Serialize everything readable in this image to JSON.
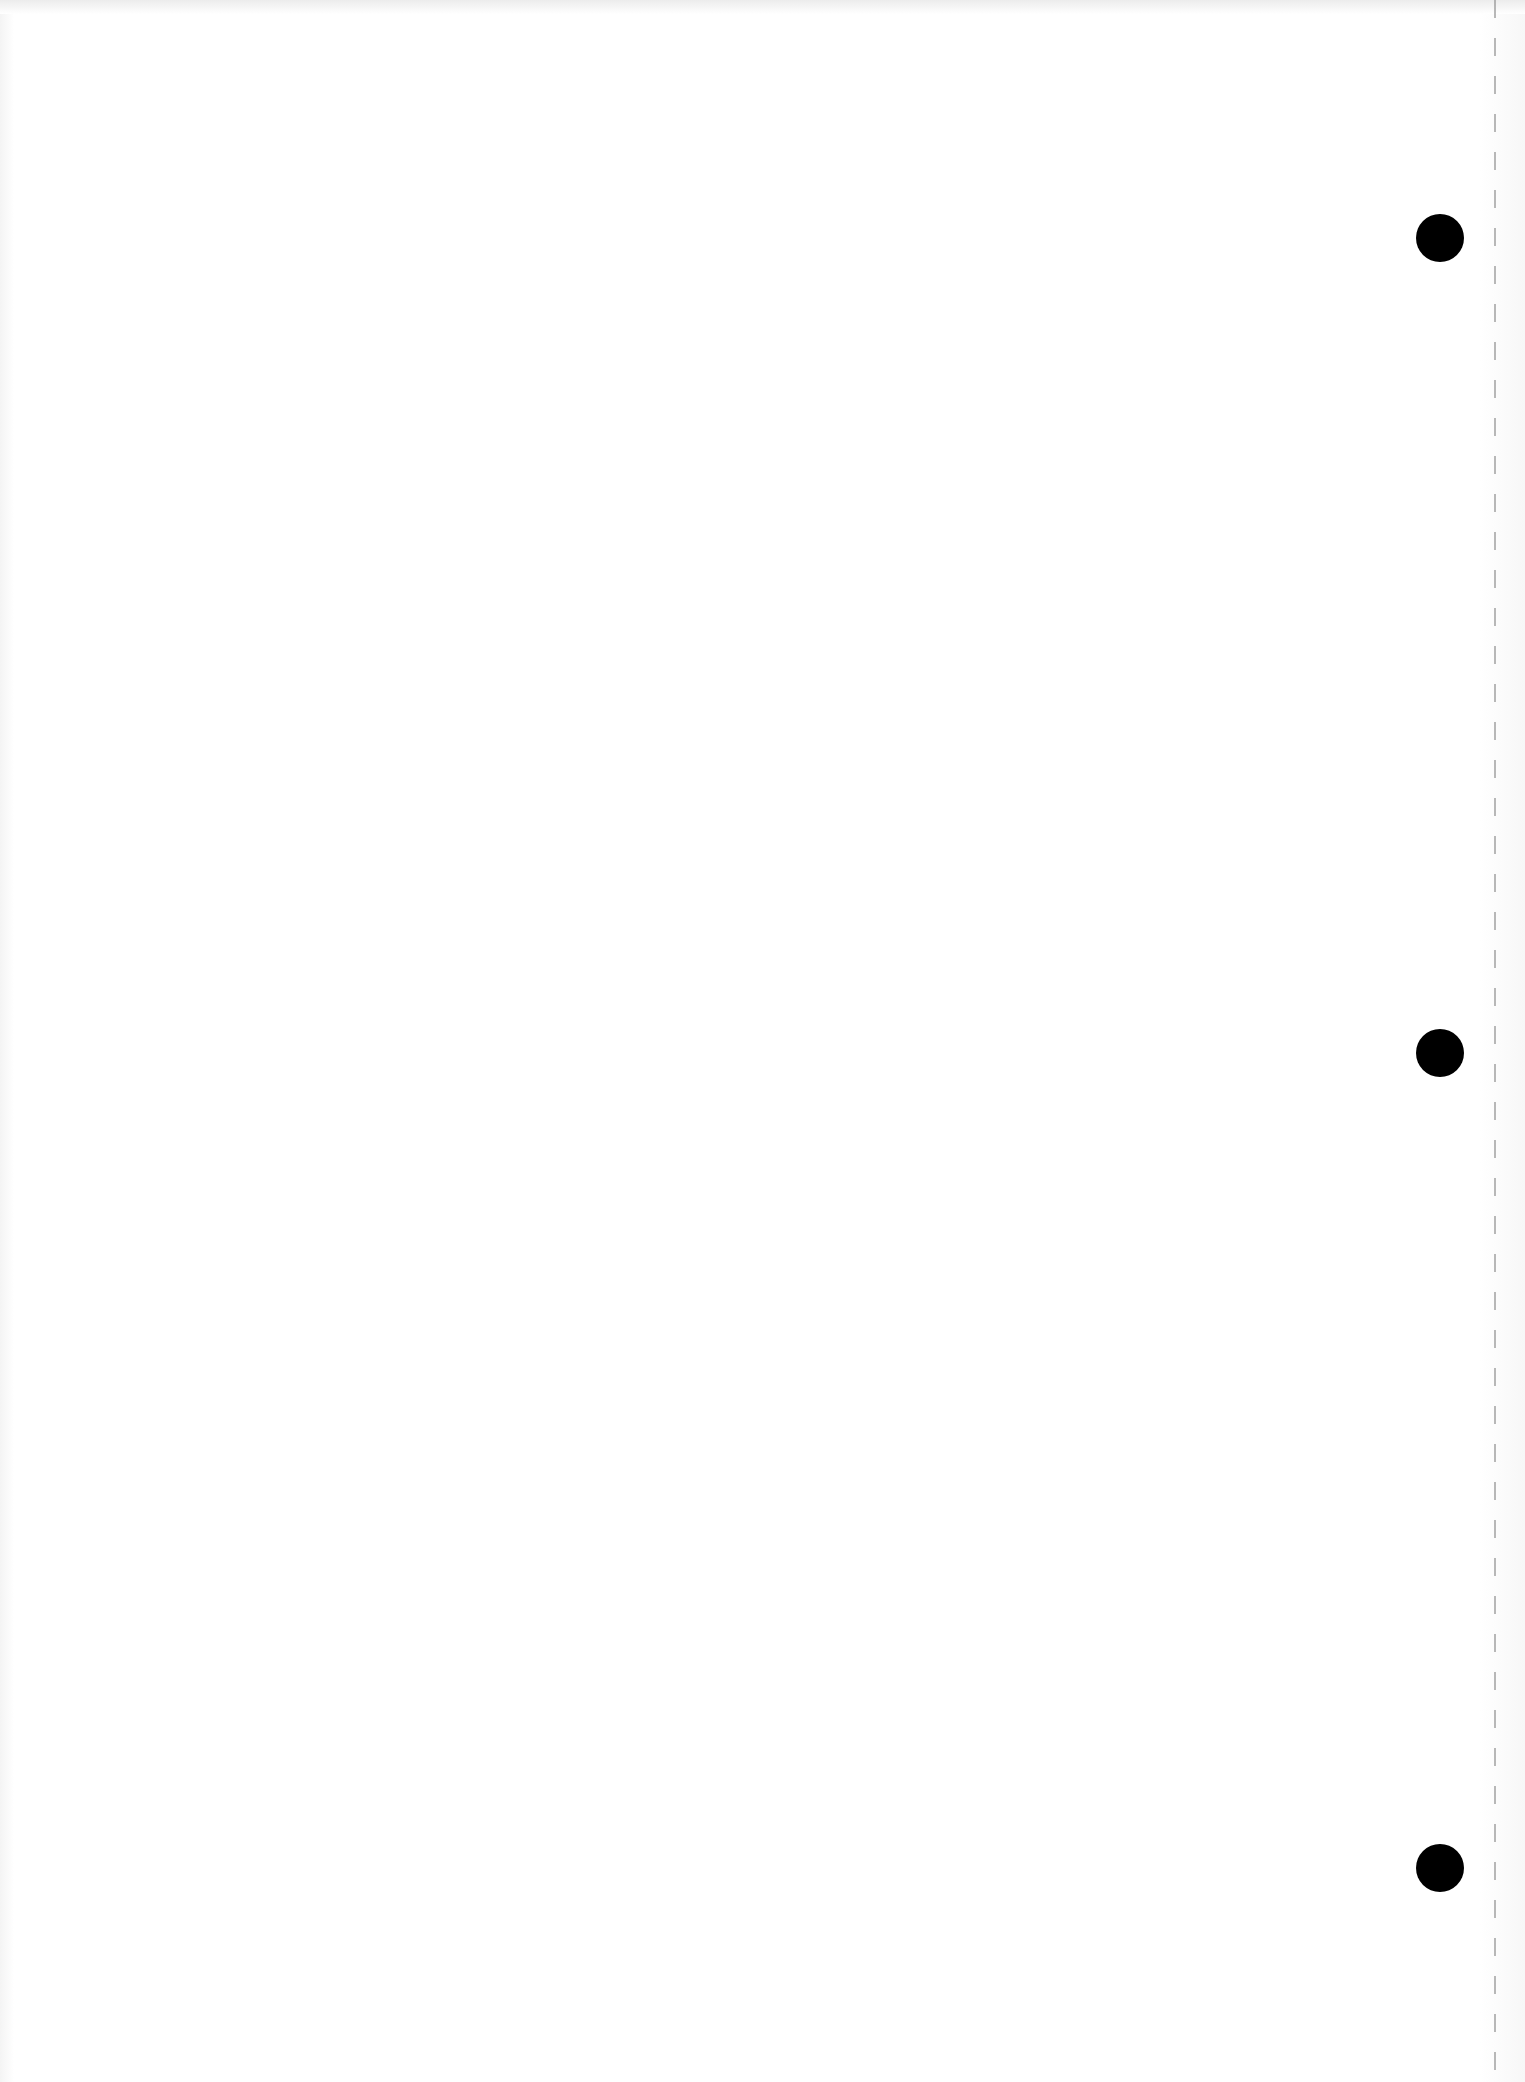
{
  "document": {
    "type": "blank scanned page",
    "text_content": "",
    "punch_holes": [
      {
        "x": 1440,
        "y": 238
      },
      {
        "x": 1440,
        "y": 1053
      },
      {
        "x": 1440,
        "y": 1868
      }
    ],
    "colors": {
      "paper": "#ffffff",
      "hole": "#000000",
      "perforation": "#9a9a9a"
    }
  }
}
